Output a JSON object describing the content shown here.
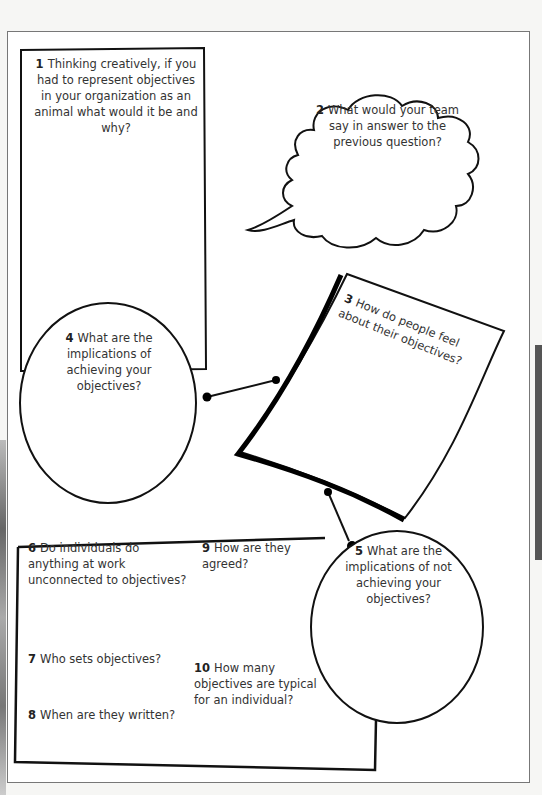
{
  "worksheet": {
    "questions": [
      {
        "num": "1",
        "text": "Thinking creatively, if you had to represent objectives in your organization as an animal what would it be and why?",
        "shape": "rectangle"
      },
      {
        "num": "2",
        "text": "What would your team say in answer to the previous question?",
        "shape": "speech-cloud"
      },
      {
        "num": "3",
        "text": "How do people feel about their objectives?",
        "shape": "tilted-paper"
      },
      {
        "num": "4",
        "text": "What are the implications of achieving your objectives?",
        "shape": "circle"
      },
      {
        "num": "5",
        "text": "What are the implications of not achieving your objectives?",
        "shape": "circle"
      },
      {
        "num": "6",
        "text": "Do individuals do anything at work unconnected to objectives?",
        "shape": "box-item"
      },
      {
        "num": "7",
        "text": "Who sets objectives?",
        "shape": "box-item"
      },
      {
        "num": "8",
        "text": "When are they written?",
        "shape": "box-item"
      },
      {
        "num": "9",
        "text": "How are they agreed?",
        "shape": "box-item"
      },
      {
        "num": "10",
        "text": "How many objectives are typical for an individual?",
        "shape": "box-item"
      }
    ]
  }
}
